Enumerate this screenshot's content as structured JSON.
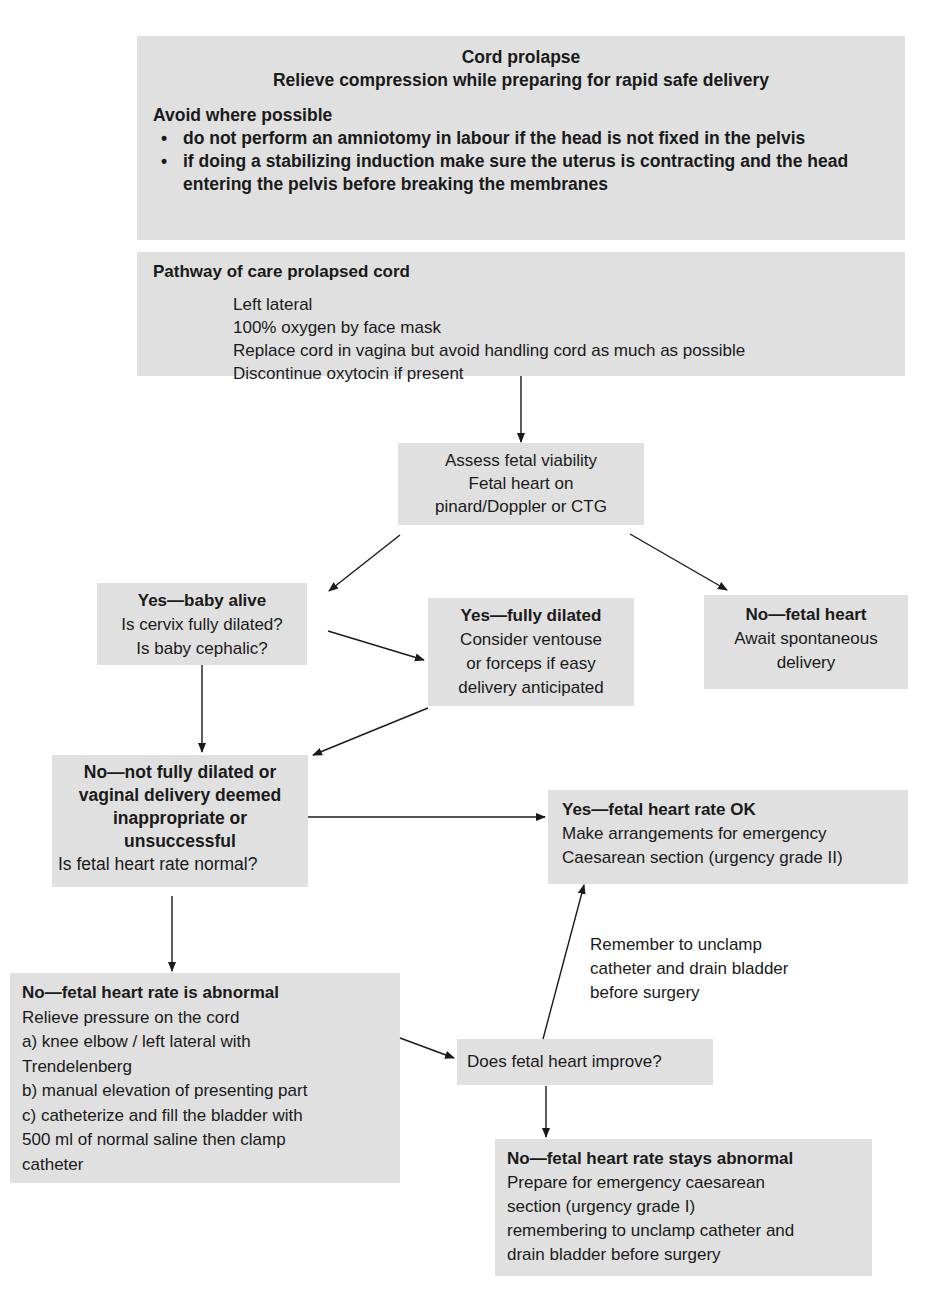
{
  "diagram": {
    "type": "flowchart",
    "box_color": "#e0e0e0",
    "line_color": "#1a1a1a"
  },
  "header_box": {
    "title": "Cord prolapse",
    "subtitle": "Relieve compression while preparing for rapid safe delivery",
    "avoid_heading": "Avoid where possible",
    "bullets": [
      "do not perform an amniotomy in labour if the head is not fixed in the pelvis",
      "if doing a stabilizing induction make sure the uterus is contracting and the head entering the pelvis before breaking the membranes"
    ]
  },
  "pathway_box": {
    "heading": "Pathway of care prolapsed cord",
    "steps": [
      "Left lateral",
      "100% oxygen by face mask",
      "Replace cord in vagina but avoid handling cord as much as possible",
      "Discontinue oxytocin if present"
    ]
  },
  "assess_box": {
    "lines": [
      "Assess fetal viability",
      "Fetal heart on",
      "pinard/Doppler or CTG"
    ]
  },
  "baby_alive_box": {
    "heading": "Yes—baby alive",
    "lines": [
      "Is cervix fully dilated?",
      "Is baby cephalic?"
    ]
  },
  "fully_dilated_box": {
    "heading": "Yes—fully dilated",
    "lines": [
      "Consider ventouse",
      "or forceps if easy",
      "delivery anticipated"
    ]
  },
  "no_fetal_heart_box": {
    "heading": "No—fetal heart",
    "lines": [
      "Await spontaneous",
      "delivery"
    ]
  },
  "not_dilated_box": {
    "heading_lines": [
      "No—not fully dilated or",
      "vaginal delivery deemed",
      "inappropriate or",
      "unsuccessful"
    ],
    "question": "Is fetal heart rate normal?"
  },
  "heart_ok_box": {
    "heading": "Yes—fetal heart rate OK",
    "lines": [
      "Make arrangements for emergency",
      "Caesarean section (urgency grade II)"
    ]
  },
  "reminder_note": {
    "lines": [
      "Remember to unclamp",
      "catheter and drain bladder",
      "before surgery"
    ]
  },
  "abnormal_box": {
    "heading": "No—fetal heart rate is abnormal",
    "lines": [
      "Relieve pressure on the cord",
      "a) knee elbow / left lateral with",
      "Trendelenberg",
      "b) manual elevation of presenting part",
      "c) catheterize and fill the bladder with",
      "500 ml of normal saline then clamp",
      "catheter"
    ]
  },
  "improve_box": {
    "text": "Does fetal heart improve?"
  },
  "stays_abnormal_box": {
    "heading": "No—fetal heart rate stays abnormal",
    "lines": [
      "Prepare for emergency caesarean",
      "section (urgency grade I)",
      "remembering to unclamp catheter and",
      "drain bladder before surgery"
    ]
  }
}
